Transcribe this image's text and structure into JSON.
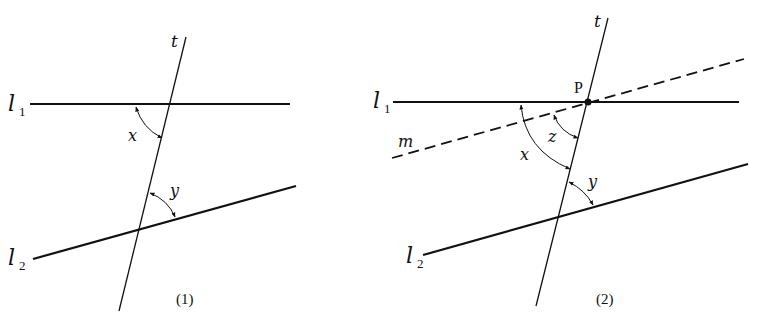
{
  "figure": {
    "panels": [
      {
        "caption": "(1)",
        "lines": {
          "l1": {
            "label": "l",
            "subscript": "1"
          },
          "l2": {
            "label": "l",
            "subscript": "2"
          },
          "t": {
            "label": "t"
          }
        },
        "angles": {
          "x": "x",
          "y": "y"
        }
      },
      {
        "caption": "(2)",
        "lines": {
          "l1": {
            "label": "l",
            "subscript": "1"
          },
          "l2": {
            "label": "l",
            "subscript": "2"
          },
          "t": {
            "label": "t"
          },
          "m": {
            "label": "m",
            "style": "dashed"
          }
        },
        "point": {
          "label": "P"
        },
        "angles": {
          "x": "x",
          "y": "y",
          "z": "z"
        }
      }
    ]
  }
}
